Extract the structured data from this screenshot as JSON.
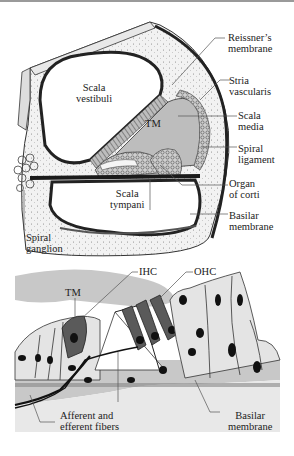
{
  "figure": {
    "top_panel": {
      "title": "Cochlea cross-section",
      "labels": {
        "scala_vestibuli": [
          "Scala",
          "vestibuli"
        ],
        "tm": "TM",
        "scala_tympani": [
          "Scala",
          "tympani"
        ],
        "spiral_ganglion": [
          "Spiral",
          "ganglion"
        ],
        "reissners_membrane": [
          "Reissner’s",
          "membrane"
        ],
        "stria_vascularis": [
          "Stria",
          "vascularis"
        ],
        "scala_media": [
          "Scala",
          "media"
        ],
        "spiral_ligament": [
          "Spiral",
          "ligament"
        ],
        "organ_of_corti": [
          "Organ",
          "of corti"
        ],
        "basilar_membrane": [
          "Basilar",
          "membrane"
        ]
      }
    },
    "bottom_panel": {
      "title": "Organ of Corti detail",
      "labels": {
        "tm": "TM",
        "ihc": "IHC",
        "ohc": "OHC",
        "fibers": [
          "Afferent and",
          "efferent fibers"
        ],
        "basilar_membrane": [
          "Basilar",
          "membrane"
        ]
      }
    },
    "colors": {
      "tissue_gray": "#c8c8c8",
      "light_gray": "#e2e2e2",
      "hair_cell_dark": "#5a5a5a",
      "line": "#1e1e1e",
      "bone_speckle": "#f0f0f0"
    }
  }
}
